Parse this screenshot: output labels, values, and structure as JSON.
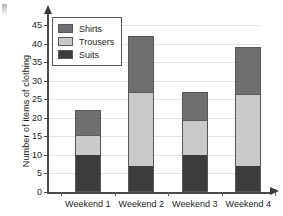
{
  "chart_data": {
    "type": "bar",
    "subtype": "stacked-bar",
    "title": "",
    "xlabel": "",
    "ylabel": "Number of items of clothing",
    "categories": [
      "Weekend 1",
      "Weekend 2",
      "Weekend 3",
      "Weekend 4"
    ],
    "series": [
      {
        "name": "Suits",
        "color": "#3c3c3c",
        "values": [
          10,
          7,
          10,
          7
        ]
      },
      {
        "name": "Trousers",
        "color": "#c9c9c9",
        "values": [
          5.5,
          20,
          9.5,
          19.5
        ]
      },
      {
        "name": "Shirts",
        "color": "#6f6f6f",
        "values": [
          6.5,
          15,
          7.5,
          12.5
        ]
      }
    ],
    "cumulative_tops": {
      "Weekend 1": {
        "suits": 10,
        "trousers": 15.5,
        "total": 22
      },
      "Weekend 2": {
        "suits": 7,
        "trousers": 27,
        "total": 42
      },
      "Weekend 3": {
        "suits": 10,
        "trousers": 19.5,
        "total": 27
      },
      "Weekend 4": {
        "suits": 7,
        "trousers": 26.5,
        "total": 39
      }
    },
    "ylim": [
      0,
      48
    ],
    "yticks": [
      0,
      5,
      10,
      15,
      20,
      25,
      30,
      35,
      40,
      45
    ],
    "ytick_labels": [
      "0",
      "5",
      "10",
      "15",
      "20",
      "25",
      "30",
      "35",
      "40",
      "45"
    ],
    "grid": true,
    "grid_axis": "y",
    "legend_position": "upper-left",
    "legend_order": [
      "Shirts",
      "Trousers",
      "Suits"
    ]
  },
  "legend": {
    "items": [
      {
        "label": "Shirts"
      },
      {
        "label": "Trousers"
      },
      {
        "label": "Suits"
      }
    ]
  },
  "axes": {
    "y_title": "Number of items of clothing",
    "y_labels": [
      "45",
      "40",
      "35",
      "30",
      "25",
      "20",
      "15",
      "10",
      "5",
      "0"
    ],
    "x_labels": [
      "Weekend 1",
      "Weekend 2",
      "Weekend 3",
      "Weekend 4"
    ]
  }
}
